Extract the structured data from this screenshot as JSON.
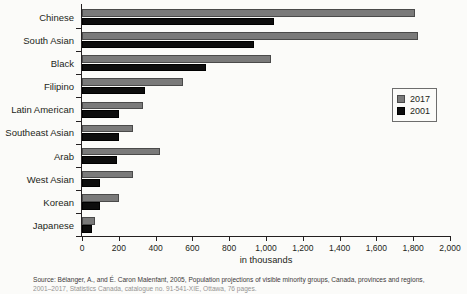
{
  "chart_data": {
    "type": "bar",
    "orientation": "horizontal",
    "title": "",
    "xlabel": "in thousands",
    "ylabel": "",
    "xlim": [
      0,
      2000
    ],
    "xticks": [
      0,
      200,
      400,
      600,
      800,
      1000,
      1200,
      1400,
      1600,
      1800,
      2000
    ],
    "xticklabels": [
      "0",
      "200",
      "400",
      "600",
      "800",
      "1,000",
      "1,200",
      "1,400",
      "1,600",
      "1,800",
      "2,000"
    ],
    "grid": false,
    "legend_position": "right",
    "categories": [
      "Chinese",
      "South Asian",
      "Black",
      "Filipino",
      "Latin American",
      "Southeast Asian",
      "Arab",
      "West Asian",
      "Korean",
      "Japanese"
    ],
    "series": [
      {
        "name": "2017",
        "color": "#7a7a7a",
        "values": [
          1810,
          1825,
          1027,
          549,
          330,
          275,
          424,
          277,
          203,
          71
        ]
      },
      {
        "name": "2001",
        "color": "#0d0d0d",
        "values": [
          1043,
          935,
          674,
          342,
          200,
          200,
          190,
          98,
          98,
          54
        ]
      }
    ]
  },
  "axis": {
    "x_title": "in thousands"
  },
  "legend": {
    "entries": [
      {
        "label": "2017"
      },
      {
        "label": "2001"
      }
    ]
  },
  "source": {
    "line1": "Source: Bélanger, A., and É. Caron Malenfant, 2005, Population projections of visible minority groups, Canada, provinces and regions,",
    "line2": "2001–2017, Statistics Canada, catalogue no. 91-541-XIE, Ottawa, 76 pages."
  }
}
